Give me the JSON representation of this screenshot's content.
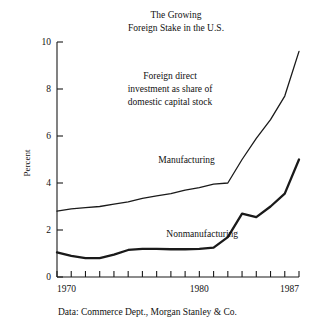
{
  "chart_data": {
    "type": "line",
    "title": "The Growing Foreign Stake in the U.S.",
    "title_lines": [
      "The Growing",
      "Foreign Stake in the U.S."
    ],
    "annotation_lines": [
      "Foreign direct",
      "investment as share of",
      "domestic capital stock"
    ],
    "xlabel": "",
    "ylabel": "Percent",
    "xlim": [
      1970,
      1987
    ],
    "ylim": [
      0,
      10
    ],
    "ytick_values": [
      0,
      2,
      4,
      6,
      8,
      10
    ],
    "ytick_labels": [
      "0",
      "2",
      "4",
      "6",
      "8",
      "10"
    ],
    "xtick_values": [
      1970,
      1971,
      1972,
      1973,
      1974,
      1975,
      1976,
      1977,
      1978,
      1979,
      1980,
      1981,
      1982,
      1983,
      1984,
      1985,
      1986,
      1987
    ],
    "xtick_labels_shown": [
      {
        "value": 1970,
        "label": "1970"
      },
      {
        "value": 1980,
        "label": "1980"
      },
      {
        "value": 1987,
        "label": "1987"
      }
    ],
    "grid": false,
    "legend_position": "inline-labels",
    "x": [
      1970,
      1971,
      1972,
      1973,
      1974,
      1975,
      1976,
      1977,
      1978,
      1979,
      1980,
      1981,
      1982,
      1983,
      1984,
      1985,
      1986,
      1987
    ],
    "series": [
      {
        "name": "Manufacturing",
        "label_x": 1979.1,
        "label_y": 4.85,
        "stroke_width": 1.3,
        "values": [
          2.8,
          2.9,
          2.95,
          3.0,
          3.1,
          3.2,
          3.35,
          3.45,
          3.55,
          3.7,
          3.8,
          3.95,
          4.0,
          5.0,
          5.9,
          6.7,
          7.7,
          9.6
        ]
      },
      {
        "name": "Nonmanufacturing",
        "label_x": 1980.2,
        "label_y": 1.72,
        "stroke_width": 2.3,
        "values": [
          1.05,
          0.9,
          0.8,
          0.8,
          0.95,
          1.15,
          1.2,
          1.2,
          1.18,
          1.18,
          1.2,
          1.25,
          1.7,
          2.7,
          2.55,
          3.0,
          3.55,
          5.0
        ]
      }
    ],
    "source_note": "Data:  Commerce Dept., Morgan Stanley & Co."
  },
  "layout": {
    "plot_left": 57,
    "plot_right": 299,
    "plot_top": 42,
    "plot_bottom": 277
  }
}
